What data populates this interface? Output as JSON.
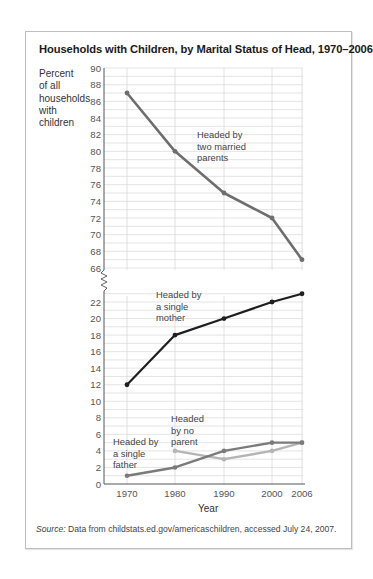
{
  "title": "Households with Children, by Marital Status of Head, 1970–2006",
  "y_axis_label": "Percent\nof all\nhouseholds\nwith\nchildren",
  "x_axis_label": "Year",
  "source_prefix": "Source:",
  "source_text": " Data from childstats.ed.gov/americaschildren, accessed July 24, 2007.",
  "colors": {
    "two_married_parents": "#6e6e6e",
    "single_mother": "#1e1e1e",
    "single_father": "#7a7a7a",
    "no_parent": "#b4b4b4",
    "grid": "#d8d8d8",
    "axis": "#555555"
  },
  "annotations": {
    "two_married_parents": [
      "Headed by",
      "two married",
      "parents"
    ],
    "single_mother": [
      "Headed by",
      "a single",
      "mother"
    ],
    "no_parent": [
      "Headed",
      "by no",
      "parent"
    ],
    "single_father": [
      "Headed by",
      "a single",
      "father"
    ]
  },
  "chart_data": {
    "type": "line",
    "title": "Households with Children, by Marital Status of Head, 1970–2006",
    "xlabel": "Year",
    "ylabel": "Percent of all households with children",
    "categories": [
      "1970",
      "1980",
      "1990",
      "2000",
      "2006"
    ],
    "x": [
      1970,
      1980,
      1990,
      2000,
      2006
    ],
    "y_ticks_upper": [
      66,
      68,
      70,
      72,
      74,
      76,
      78,
      80,
      82,
      84,
      86,
      88,
      90
    ],
    "y_ticks_lower": [
      0,
      2,
      4,
      6,
      8,
      10,
      12,
      14,
      16,
      18,
      20,
      22
    ],
    "axis_break": "between 22 and 66",
    "ylim": [
      0,
      90
    ],
    "grid": true,
    "legend": "inline annotations",
    "series": [
      {
        "name": "Headed by two married parents",
        "values": [
          87,
          80,
          75,
          72,
          67
        ]
      },
      {
        "name": "Headed by a single mother",
        "values": [
          12,
          18,
          20,
          22,
          23
        ]
      },
      {
        "name": "Headed by a single father",
        "values": [
          1,
          2,
          4,
          5,
          5
        ]
      },
      {
        "name": "Headed by no parent",
        "values": [
          null,
          4,
          3,
          4,
          5
        ]
      }
    ]
  }
}
